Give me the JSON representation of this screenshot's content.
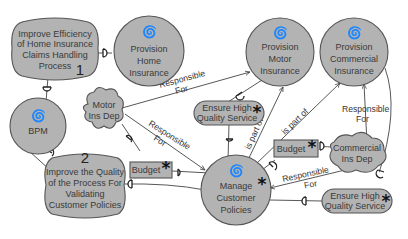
{
  "colors": {
    "node_fill": "#b3b3b3",
    "node_stroke": "#555555",
    "edge": "#444444",
    "background": "#ffffff"
  },
  "nodes": {
    "softgoal_claims": {
      "type": "softgoal",
      "lines": [
        "Improve Efficiency",
        "of Home Insurance",
        "Claims Handling",
        "Process"
      ],
      "number": "1"
    },
    "actor_home": {
      "type": "actor",
      "icon": "actor-swirl-icon",
      "lines": [
        "Provision",
        "Home",
        "Insurance"
      ]
    },
    "actor_motor": {
      "type": "actor",
      "icon": "actor-swirl-icon",
      "lines": [
        "Provision",
        "Motor",
        "Insurance"
      ]
    },
    "actor_commercial": {
      "type": "actor",
      "icon": "actor-swirl-icon",
      "lines": [
        "Provision",
        "Commercial",
        "Insurance"
      ]
    },
    "actor_bpm": {
      "type": "actor",
      "icon": "actor-swirl-icon",
      "lines": [
        "BPM"
      ]
    },
    "agent_motor_dep": {
      "type": "cloud",
      "lines": [
        "Motor",
        "Ins Dep"
      ]
    },
    "goal_quality_1": {
      "type": "goal",
      "lines": [
        "Ensure High",
        "Quality Service"
      ],
      "star": "*"
    },
    "softgoal_validate": {
      "type": "softgoal",
      "lines": [
        "Improve the Quality",
        "of the Process For",
        "Validating",
        "Customer Policies"
      ],
      "number": "2"
    },
    "resource_budget_1": {
      "type": "resource",
      "lines": [
        "Budget"
      ],
      "star": "*"
    },
    "actor_manage": {
      "type": "actor",
      "icon": "actor-swirl-icon",
      "lines": [
        "Manage",
        "Customer",
        "Policies"
      ],
      "star": "*"
    },
    "resource_budget_2": {
      "type": "resource",
      "lines": [
        "Budget"
      ],
      "star": "*"
    },
    "agent_commercial_dep": {
      "type": "cloud",
      "lines": [
        "Commercial",
        "Ins Dep"
      ]
    },
    "goal_quality_2": {
      "type": "goal",
      "lines": [
        "Ensure High",
        "Quality Service"
      ],
      "star": "*"
    }
  },
  "edge_labels": {
    "resp_motor_top": [
      "Responsible",
      "For"
    ],
    "resp_motor_mid": [
      "Responsible",
      "For"
    ],
    "part_of_1": "is part of",
    "part_of_2": "is part of",
    "resp_commercial": [
      "Responsible",
      "For"
    ],
    "resp_manage": [
      "Responsible",
      "For"
    ]
  }
}
